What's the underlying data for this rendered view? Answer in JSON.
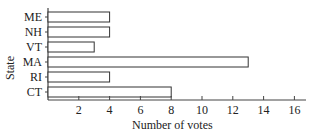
{
  "chart_data": {
    "type": "bar",
    "orientation": "horizontal",
    "title": "",
    "xlabel": "Number of votes",
    "ylabel": "State",
    "categories": [
      "ME",
      "NH",
      "VT",
      "MA",
      "RI",
      "CT"
    ],
    "values": [
      4,
      4,
      3,
      13,
      4,
      8
    ],
    "xlim": [
      0,
      17
    ],
    "xticks": [
      2,
      4,
      6,
      8,
      10,
      12,
      14,
      16
    ],
    "grid": false,
    "legend": null,
    "bar_fill": "#ffffff",
    "bar_stroke": "#333333"
  }
}
